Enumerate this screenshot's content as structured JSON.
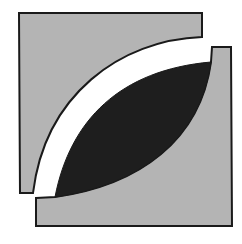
{
  "image": {
    "kind": "abstract-logo",
    "description": "Square emblem of two grey L-like blocks separated by a white curved band and a dark leaf/lens shape",
    "width": 242,
    "height": 244
  },
  "colors": {
    "background": "#ffffff",
    "grey_fill": "#b4b4b4",
    "dark_fill": "#1e1e1e",
    "outline": "#1a1a1a",
    "band": "#ffffff"
  },
  "shapes": {
    "top_left_block": {
      "path": "M19,13 L202,13 L202,37 C120,40 45,95 33,193 L20,193 Z"
    },
    "bottom_right_block": {
      "path": "M36,198 L55,197 C140,185 200,140 211,62 L212,47 L231,47 L232,226 L36,226 Z"
    },
    "dark_lens": {
      "path": "M55,197 C70,120 120,70 211,62 C200,140 140,185 55,197 Z"
    }
  }
}
